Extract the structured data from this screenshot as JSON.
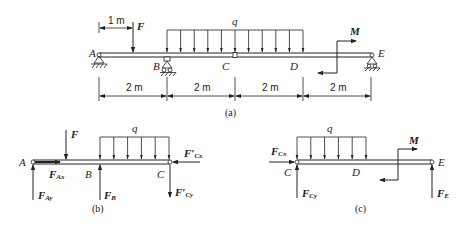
{
  "panel_a": {
    "caption": "(a)",
    "points": {
      "A": "A",
      "B": "B",
      "C": "C",
      "D": "D",
      "E": "E"
    },
    "force_F": "F",
    "load_q": "q",
    "moment_M": "M",
    "offset_label": "1 m",
    "dimensions": [
      "2 m",
      "2 m",
      "2 m",
      "2 m"
    ]
  },
  "panel_b": {
    "caption": "(b)",
    "points": {
      "A": "A",
      "B": "B",
      "C": "C"
    },
    "force_F": "F",
    "load_q": "q",
    "forces": {
      "FAx": {
        "main": "F",
        "sub": "Ax"
      },
      "FAy": {
        "main": "F",
        "sub": "Ay"
      },
      "FB": {
        "main": "F",
        "sub": "B"
      },
      "FCx_prime": {
        "main": "F′",
        "sub": "Cx"
      },
      "FCy_prime": {
        "main": "F′",
        "sub": "Cy"
      }
    }
  },
  "panel_c": {
    "caption": "(c)",
    "points": {
      "C": "C",
      "D": "D",
      "E": "E"
    },
    "load_q": "q",
    "moment_M": "M",
    "forces": {
      "FCx": {
        "main": "F",
        "sub": "Cx"
      },
      "FCy": {
        "main": "F",
        "sub": "Cy"
      },
      "FE": {
        "main": "F",
        "sub": "E"
      }
    }
  }
}
